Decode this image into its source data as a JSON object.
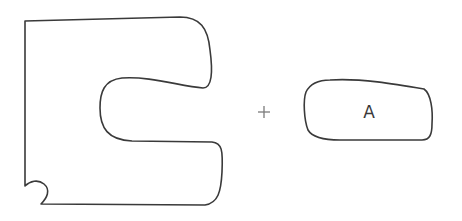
{
  "diagram": {
    "operator": "+",
    "piece_a": {
      "label": "A"
    },
    "colors": {
      "stroke": "#3a3a3a",
      "operator": "#7a7a7a",
      "background": "#ffffff"
    }
  }
}
